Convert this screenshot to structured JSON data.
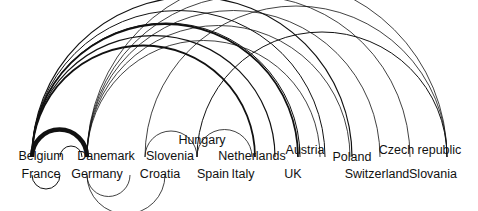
{
  "diagram": {
    "type": "arc-diagram",
    "nodes": [
      {
        "id": "belgium",
        "label": "Belgium",
        "x": 41,
        "y": 150
      },
      {
        "id": "france",
        "label": "France",
        "x": 41,
        "y": 168
      },
      {
        "id": "denmark",
        "label": "Danemark",
        "x": 106,
        "y": 150
      },
      {
        "id": "germany",
        "label": "Germany",
        "x": 97,
        "y": 168
      },
      {
        "id": "slovenia",
        "label": "Slovenia",
        "x": 170,
        "y": 150
      },
      {
        "id": "croatia",
        "label": "Croatia",
        "x": 160,
        "y": 168
      },
      {
        "id": "hungary",
        "label": "Hungary",
        "x": 202,
        "y": 134
      },
      {
        "id": "spain",
        "label": "Spain",
        "x": 213,
        "y": 168
      },
      {
        "id": "netherlands",
        "label": "Netherlands",
        "x": 252,
        "y": 150
      },
      {
        "id": "italy",
        "label": "Italy",
        "x": 243,
        "y": 168
      },
      {
        "id": "austria",
        "label": "Austria",
        "x": 305,
        "y": 144
      },
      {
        "id": "uk",
        "label": "UK",
        "x": 293,
        "y": 168
      },
      {
        "id": "poland",
        "label": "Poland",
        "x": 352,
        "y": 151
      },
      {
        "id": "switzerland",
        "label": "Switzerland",
        "x": 377,
        "y": 168
      },
      {
        "id": "czech",
        "label": "Czech republic",
        "x": 420,
        "y": 144
      },
      {
        "id": "slovania",
        "label": "Slovania",
        "x": 433,
        "y": 168
      }
    ],
    "edges": [
      {
        "from_x": 32,
        "to_x": 87,
        "y": 157,
        "above": true,
        "width": 4.5
      },
      {
        "from_x": 32,
        "to_x": 298,
        "y": 157,
        "above": true,
        "width": 1.8
      },
      {
        "from_x": 32,
        "to_x": 255,
        "y": 157,
        "above": true,
        "width": 1.8
      },
      {
        "from_x": 32,
        "to_x": 275,
        "y": 157,
        "above": true,
        "width": 1.2
      },
      {
        "from_x": 32,
        "to_x": 325,
        "y": 157,
        "above": true,
        "width": 1.0
      },
      {
        "from_x": 32,
        "to_x": 352,
        "y": 157,
        "above": true,
        "width": 1.2
      },
      {
        "from_x": 32,
        "to_x": 300,
        "y": 157,
        "above": true,
        "width": 1.0
      },
      {
        "from_x": 87,
        "to_x": 410,
        "y": 157,
        "above": true,
        "width": 0.8
      },
      {
        "from_x": 87,
        "to_x": 447,
        "y": 157,
        "above": true,
        "width": 0.8
      },
      {
        "from_x": 87,
        "to_x": 380,
        "y": 157,
        "above": true,
        "width": 0.8
      },
      {
        "from_x": 87,
        "to_x": 350,
        "y": 157,
        "above": true,
        "width": 0.8
      },
      {
        "from_x": 87,
        "to_x": 320,
        "y": 157,
        "above": true,
        "width": 0.8
      },
      {
        "from_x": 145,
        "to_x": 447,
        "y": 157,
        "above": true,
        "width": 0.8
      },
      {
        "from_x": 197,
        "to_x": 447,
        "y": 157,
        "above": true,
        "width": 1.0
      },
      {
        "from_x": 145,
        "to_x": 197,
        "y": 157,
        "above": true,
        "width": 0.8
      },
      {
        "from_x": 197,
        "to_x": 252,
        "y": 157,
        "above": true,
        "width": 0.8
      },
      {
        "from_x": 60,
        "to_x": 82,
        "y": 157,
        "above": true,
        "width": 1.0
      },
      {
        "from_x": 87,
        "to_x": 130,
        "y": 175,
        "above": false,
        "width": 0.8
      },
      {
        "from_x": 87,
        "to_x": 165,
        "y": 175,
        "above": false,
        "width": 0.8
      },
      {
        "from_x": 32,
        "to_x": 60,
        "y": 175,
        "above": false,
        "width": 1.0
      }
    ]
  }
}
